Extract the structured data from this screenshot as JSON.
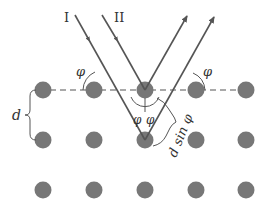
{
  "diagram": {
    "colors": {
      "atom": "#777777",
      "ray": "#555555",
      "dashed_plane": "#555555",
      "label": "#333333",
      "background": "#ffffff"
    },
    "lattice": {
      "rows_y": [
        90,
        140,
        190
      ],
      "cols_x": [
        43,
        94,
        145,
        196,
        246
      ],
      "atom_radius": 8.5
    },
    "plane_line": {
      "style": "dashed",
      "y": 90,
      "x1": 50,
      "x2": 240
    },
    "rays": [
      {
        "id": "I",
        "label": "I",
        "incident_start": [
          75,
          15
        ],
        "reflection_point": [
          145,
          140
        ],
        "reflected_end": [
          214,
          16
        ]
      },
      {
        "id": "II",
        "label": "II",
        "incident_start": [
          102,
          15
        ],
        "reflection_point": [
          145,
          90
        ],
        "reflected_end": [
          187,
          15
        ]
      }
    ],
    "labels": {
      "ray_one": "I",
      "ray_two": "II",
      "angle_left": "φ",
      "angle_right": "φ",
      "angle_inner_left": "φ",
      "angle_inner_right": "φ",
      "spacing": "d",
      "path_difference": "d sin φ"
    }
  }
}
